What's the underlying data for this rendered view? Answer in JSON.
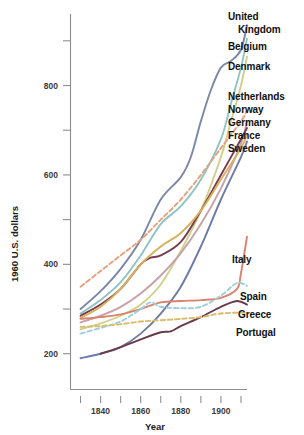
{
  "chart_data": {
    "type": "line",
    "title": "",
    "xlabel": "Year",
    "ylabel": "1960 U.S. dollars",
    "xlim": [
      1825,
      1913
    ],
    "ylim": [
      120,
      960
    ],
    "grid": false,
    "legend_position": "right-inline-labels",
    "x_ticks": [
      1830,
      1840,
      1850,
      1860,
      1870,
      1880,
      1890,
      1900,
      1910
    ],
    "x_tick_labels": [
      "",
      "1840",
      "",
      "1860",
      "",
      "1880",
      "",
      "1900",
      ""
    ],
    "y_ticks": [
      200,
      300,
      400,
      500,
      600,
      700,
      800,
      900
    ],
    "y_tick_labels": [
      "200",
      "",
      "400",
      "",
      "600",
      "",
      "800",
      ""
    ],
    "series": [
      {
        "name": "United Kingdom",
        "color": "#7b86a8",
        "dashed": false,
        "x": [
          1830,
          1840,
          1850,
          1860,
          1870,
          1880,
          1885,
          1890,
          1895,
          1900,
          1905,
          1910,
          1913
        ],
        "values": [
          300,
          340,
          390,
          455,
          545,
          595,
          640,
          720,
          790,
          840,
          855,
          880,
          935
        ]
      },
      {
        "name": "Belgium",
        "color": "#8fc4c2",
        "dashed": false,
        "x": [
          1830,
          1840,
          1850,
          1860,
          1870,
          1880,
          1890,
          1900,
          1905,
          1910,
          1913
        ],
        "values": [
          290,
          320,
          360,
          420,
          490,
          530,
          590,
          680,
          760,
          840,
          905
        ]
      },
      {
        "name": "Denmark",
        "color": "#cfd08a",
        "dashed": false,
        "x": [
          1830,
          1840,
          1850,
          1860,
          1870,
          1880,
          1890,
          1900,
          1905,
          1910,
          1913
        ],
        "values": [
          255,
          268,
          285,
          310,
          355,
          430,
          520,
          640,
          720,
          800,
          865
        ]
      },
      {
        "name": "Netherlands",
        "color": "#e8a07c",
        "dashed": true,
        "x": [
          1830,
          1840,
          1850,
          1860,
          1870,
          1880,
          1890,
          1900,
          1910,
          1913
        ],
        "values": [
          350,
          385,
          420,
          455,
          500,
          545,
          600,
          660,
          720,
          745
        ]
      },
      {
        "name": "Norway",
        "color": "#c8a0a8",
        "dashed": false,
        "x": [
          1830,
          1840,
          1850,
          1860,
          1870,
          1880,
          1890,
          1900,
          1910,
          1913
        ],
        "values": [
          270,
          285,
          305,
          335,
          375,
          425,
          490,
          570,
          670,
          720
        ]
      },
      {
        "name": "Germany",
        "color": "#7a3a52",
        "dashed": false,
        "x": [
          1830,
          1840,
          1850,
          1860,
          1865,
          1870,
          1880,
          1890,
          1900,
          1910,
          1913
        ],
        "values": [
          285,
          310,
          345,
          400,
          415,
          420,
          450,
          520,
          600,
          680,
          705
        ]
      },
      {
        "name": "France",
        "color": "#d8b05a",
        "dashed": false,
        "x": [
          1830,
          1840,
          1850,
          1860,
          1870,
          1880,
          1890,
          1900,
          1910,
          1913
        ],
        "values": [
          280,
          305,
          345,
          400,
          440,
          470,
          520,
          590,
          660,
          690
        ]
      },
      {
        "name": "Sweden",
        "color": "#6c7ba6",
        "dashed": false,
        "x": [
          1830,
          1840,
          1850,
          1860,
          1870,
          1880,
          1890,
          1900,
          1910,
          1913
        ],
        "values": [
          190,
          200,
          215,
          245,
          290,
          350,
          440,
          545,
          640,
          675
        ]
      },
      {
        "name": "Italy",
        "color": "#d8836d",
        "dashed": false,
        "x": [
          1830,
          1840,
          1850,
          1860,
          1870,
          1880,
          1890,
          1900,
          1908,
          1910,
          1913
        ],
        "values": [
          278,
          282,
          288,
          300,
          315,
          318,
          320,
          325,
          345,
          380,
          462
        ]
      },
      {
        "name": "Spain",
        "color": "#9ecede",
        "dashed": true,
        "x": [
          1830,
          1840,
          1850,
          1860,
          1865,
          1870,
          1880,
          1890,
          1900,
          1908,
          1913
        ],
        "values": [
          245,
          258,
          272,
          300,
          315,
          305,
          302,
          305,
          330,
          358,
          352
        ]
      },
      {
        "name": "Greece",
        "color": "#6b3a4a",
        "dashed": false,
        "x": [
          1840,
          1850,
          1860,
          1870,
          1875,
          1880,
          1890,
          1900,
          1908,
          1913
        ],
        "values": [
          200,
          215,
          232,
          248,
          250,
          262,
          282,
          305,
          318,
          310
        ]
      },
      {
        "name": "Portugal",
        "color": "#d9bb6a",
        "dashed": true,
        "x": [
          1830,
          1840,
          1850,
          1860,
          1870,
          1880,
          1890,
          1900,
          1910,
          1913
        ],
        "values": [
          260,
          262,
          266,
          272,
          275,
          278,
          282,
          290,
          292,
          290
        ]
      }
    ]
  },
  "labels": {
    "united_kingdom_1": "United",
    "united_kingdom_2": "Kingdom",
    "belgium": "Belgium",
    "denmark": "Denmark",
    "netherlands": "Netherlands",
    "norway": "Norway",
    "germany": "Germany",
    "france": "France",
    "sweden": "Sweden",
    "italy": "Italy",
    "spain": "Spain",
    "greece": "Greece",
    "portugal": "Portugal"
  },
  "axes": {
    "y_title": "1960 U.S. dollars",
    "x_title": "Year",
    "y_labels": [
      "800",
      "600",
      "400",
      "200"
    ],
    "x_labels": [
      "1840",
      "1860",
      "1880",
      "1900"
    ]
  }
}
